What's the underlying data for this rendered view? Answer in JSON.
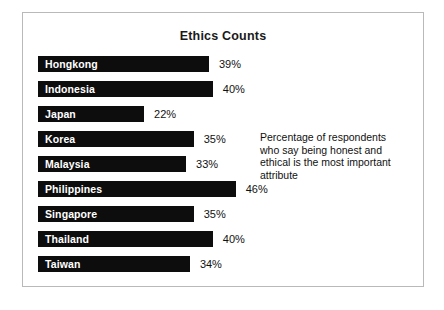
{
  "chart_data": {
    "type": "bar",
    "title": "Ethics Counts",
    "xlabel": "",
    "ylabel": "",
    "orientation": "horizontal",
    "grid": false,
    "legend": "none",
    "xlim": [
      0,
      50
    ],
    "value_suffix": "%",
    "categories": [
      "Hongkong",
      "Indonesia",
      "Japan",
      "Korea",
      "Malaysia",
      "Philippines",
      "Singapore",
      "Thailand",
      "Taiwan"
    ],
    "values": [
      39,
      40,
      22,
      35,
      33,
      46,
      35,
      40,
      34
    ],
    "value_labels": [
      "39%",
      "40%",
      "22%",
      "35%",
      "33%",
      "46%",
      "35%",
      "40%",
      "34%"
    ],
    "bars": [
      {
        "label": "Hongkong",
        "value": 39,
        "value_label": "39%"
      },
      {
        "label": "Indonesia",
        "value": 40,
        "value_label": "40%"
      },
      {
        "label": "Japan",
        "value": 22,
        "value_label": "22%"
      },
      {
        "label": "Korea",
        "value": 35,
        "value_label": "35%"
      },
      {
        "label": "Malaysia",
        "value": 33,
        "value_label": "33%"
      },
      {
        "label": "Philippines",
        "value": 46,
        "value_label": "46%"
      },
      {
        "label": "Singapore",
        "value": 35,
        "value_label": "35%"
      },
      {
        "label": "Thailand",
        "value": 40,
        "value_label": "40%"
      },
      {
        "label": "Taiwan",
        "value": 34,
        "value_label": "34%"
      }
    ],
    "annotation": {
      "lines": [
        "Percentage of respondents",
        "who say being honest and",
        "ethical is the most important",
        "attribute"
      ]
    },
    "colors": {
      "bar": "#0d0d0d",
      "bar_label_text": "#ffffff",
      "value_text": "#111111",
      "background": "#ffffff",
      "frame_border": "#b9b9b9"
    }
  }
}
